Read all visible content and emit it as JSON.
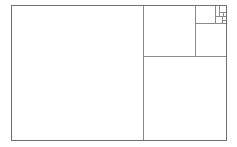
{
  "canvas": {
    "width": 237,
    "height": 147,
    "background_color": "#ffffff",
    "title": "Fibonacci rectangle subdivision"
  },
  "style": {
    "stroke_color": "#8a8a8a",
    "stroke_color_dark": "#6f6f6f",
    "stroke_width": 1,
    "fill_color": "none"
  },
  "diagram": {
    "type": "golden-ratio-rectangle-subdivision",
    "outer_rect": {
      "name": "outer-rectangle",
      "x": 11,
      "y": 5,
      "width": 215,
      "height": 135
    },
    "squares": [
      {
        "name": "square-1",
        "order": 1,
        "x": 11,
        "y": 5,
        "width": 132,
        "height": 135,
        "label": ""
      },
      {
        "name": "square-2",
        "order": 2,
        "x": 143,
        "y": 56,
        "width": 83,
        "height": 84,
        "label": ""
      },
      {
        "name": "square-3",
        "order": 3,
        "x": 143,
        "y": 5,
        "width": 52,
        "height": 51,
        "label": ""
      },
      {
        "name": "square-4",
        "order": 4,
        "x": 195,
        "y": 23,
        "width": 31,
        "height": 33,
        "label": ""
      },
      {
        "name": "square-5",
        "order": 5,
        "x": 195,
        "y": 5,
        "width": 20,
        "height": 18,
        "label": ""
      },
      {
        "name": "square-6",
        "order": 6,
        "x": 215,
        "y": 5,
        "width": 11,
        "height": 11,
        "label": ""
      },
      {
        "name": "square-7",
        "order": 7,
        "x": 215,
        "y": 16,
        "width": 7,
        "height": 7,
        "label": ""
      },
      {
        "name": "square-8",
        "order": 8,
        "x": 222,
        "y": 16,
        "width": 4,
        "height": 4,
        "label": ""
      },
      {
        "name": "square-9",
        "order": 9,
        "x": 219,
        "y": 5,
        "width": 7,
        "height": 7,
        "label": ""
      },
      {
        "name": "square-10",
        "order": 10,
        "x": 219,
        "y": 12,
        "width": 4,
        "height": 4,
        "label": ""
      }
    ],
    "divider_lines": [
      {
        "name": "divider-vertical-main",
        "x1": 143,
        "y1": 5,
        "x2": 143,
        "y2": 140
      },
      {
        "name": "divider-horizontal-right",
        "x1": 143,
        "y1": 56,
        "x2": 226,
        "y2": 56
      },
      {
        "name": "divider-vertical-upper-right",
        "x1": 195,
        "y1": 5,
        "x2": 195,
        "y2": 56
      },
      {
        "name": "divider-horizontal-upper-right",
        "x1": 195,
        "y1": 23,
        "x2": 226,
        "y2": 23
      },
      {
        "name": "divider-vertical-tiny",
        "x1": 215,
        "y1": 5,
        "x2": 215,
        "y2": 23
      },
      {
        "name": "divider-horizontal-tiny",
        "x1": 215,
        "y1": 16,
        "x2": 226,
        "y2": 16
      },
      {
        "name": "divider-vertical-micro",
        "x1": 219,
        "y1": 5,
        "x2": 219,
        "y2": 16
      },
      {
        "name": "divider-horizontal-micro",
        "x1": 219,
        "y1": 12,
        "x2": 226,
        "y2": 12
      }
    ]
  }
}
